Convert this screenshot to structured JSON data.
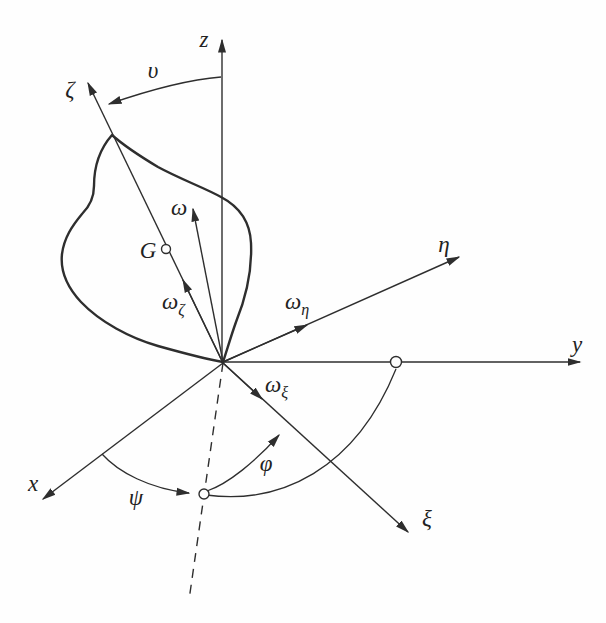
{
  "diagram": {
    "colors": {
      "ink": "#2e2e2e",
      "background": "#fefefe"
    },
    "labels": {
      "z_axis": "z",
      "y_axis": "y",
      "x_axis": "x",
      "zeta_axis": "ζ",
      "eta_axis": "η",
      "xi_axis": "ξ",
      "nutation_angle": "υ",
      "precession_angle": "ψ",
      "rotation_angle": "φ",
      "omega_vector": "ω",
      "omega_zeta": {
        "base": "ω",
        "sub": "ζ"
      },
      "omega_eta": {
        "base": "ω",
        "sub": "η"
      },
      "omega_xi": {
        "base": "ω",
        "sub": "ξ"
      },
      "center_of_mass": "G"
    }
  }
}
